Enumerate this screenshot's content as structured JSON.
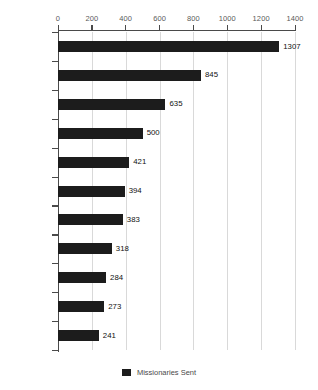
{
  "chart_data": {
    "type": "bar",
    "orientation": "horizontal",
    "title": "",
    "xlabel": "",
    "ylabel": "",
    "categories": [
      "GMS",
      "PCK (T)",
      "Methodist",
      "K. Baptist",
      "PCK (R1)",
      "Evan (YS)",
      "PCK (R2)",
      "PCK (DS)",
      "AOG",
      "PCK (KS)",
      "Evan (KS)"
    ],
    "values": [
      1307,
      845,
      635,
      500,
      421,
      394,
      383,
      318,
      284,
      273,
      241
    ],
    "series": [
      {
        "name": "Missionaries Sent",
        "values": [
          1307,
          845,
          635,
          500,
          421,
          394,
          383,
          318,
          284,
          273,
          241
        ],
        "color": "#1c1c1c"
      }
    ],
    "xlim": [
      0,
      1400
    ],
    "xticks": [
      0,
      200,
      400,
      600,
      800,
      1000,
      1200,
      1400
    ],
    "xtick_labels": [
      "0",
      "200",
      "400",
      "600",
      "800",
      "1000",
      "1200",
      "1400"
    ],
    "axis_position": "top",
    "grid": true,
    "grid_axis": "x",
    "data_labels": true,
    "legend": {
      "position": "bottom",
      "entries": [
        {
          "label": "Missionaries Sent",
          "color": "#1c1c1c"
        }
      ]
    }
  },
  "colors": {
    "bar": "#1c1c1c",
    "grid": "#d9d9d9",
    "axis": "#4a4a4a",
    "tick_label": "#5a5a5a",
    "category_label": "#5c5c5c",
    "value_label": "#111111",
    "background": "#ffffff"
  }
}
